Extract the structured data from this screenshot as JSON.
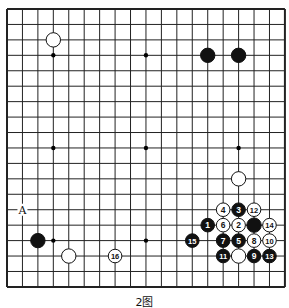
{
  "caption": "2图",
  "board": {
    "size": 19,
    "origin": [
      7,
      9
    ],
    "spacing": 15.44,
    "line_color": "#222222",
    "star_points": [
      [
        3,
        3
      ],
      [
        9,
        3
      ],
      [
        15,
        3
      ],
      [
        3,
        9
      ],
      [
        9,
        9
      ],
      [
        15,
        9
      ],
      [
        3,
        15
      ],
      [
        9,
        15
      ],
      [
        15,
        15
      ]
    ],
    "stones": [
      {
        "color": "white",
        "col": 3,
        "row": 2,
        "label": ""
      },
      {
        "color": "black",
        "col": 13,
        "row": 3,
        "label": ""
      },
      {
        "color": "black",
        "col": 15,
        "row": 3,
        "label": ""
      },
      {
        "color": "white",
        "col": 15,
        "row": 11,
        "label": ""
      },
      {
        "color": "black",
        "col": 2,
        "row": 15,
        "label": ""
      },
      {
        "color": "white",
        "col": 4,
        "row": 16,
        "label": ""
      },
      {
        "color": "white",
        "col": 7,
        "row": 16,
        "label": "16"
      },
      {
        "color": "white",
        "col": 14,
        "row": 13,
        "label": "4"
      },
      {
        "color": "black",
        "col": 15,
        "row": 13,
        "label": "3"
      },
      {
        "color": "white",
        "col": 16,
        "row": 13,
        "label": "12"
      },
      {
        "color": "black",
        "col": 13,
        "row": 14,
        "label": "1"
      },
      {
        "color": "white",
        "col": 14,
        "row": 14,
        "label": "6"
      },
      {
        "color": "white",
        "col": 15,
        "row": 14,
        "label": "2"
      },
      {
        "color": "black",
        "col": 16,
        "row": 14,
        "label": ""
      },
      {
        "color": "white",
        "col": 17,
        "row": 14,
        "label": "14"
      },
      {
        "color": "black",
        "col": 12,
        "row": 15,
        "label": "15"
      },
      {
        "color": "black",
        "col": 14,
        "row": 15,
        "label": "7"
      },
      {
        "color": "black",
        "col": 15,
        "row": 15,
        "label": "5"
      },
      {
        "color": "white",
        "col": 16,
        "row": 15,
        "label": "8"
      },
      {
        "color": "white",
        "col": 17,
        "row": 15,
        "label": "10"
      },
      {
        "color": "black",
        "col": 14,
        "row": 16,
        "label": "11"
      },
      {
        "color": "white",
        "col": 15,
        "row": 16,
        "label": ""
      },
      {
        "color": "black",
        "col": 16,
        "row": 16,
        "label": "9"
      },
      {
        "color": "black",
        "col": 17,
        "row": 16,
        "label": "13"
      }
    ],
    "markers": [
      {
        "col": 1,
        "row": 13,
        "label": "A"
      }
    ]
  }
}
